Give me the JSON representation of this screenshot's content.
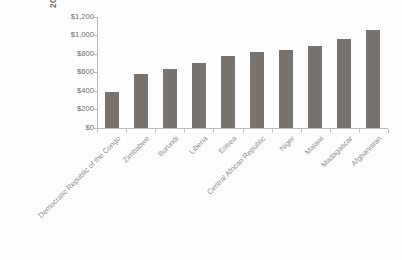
{
  "chart_data": {
    "type": "bar",
    "title": "",
    "subtitle": "",
    "xlabel": "",
    "ylabel": "2013 U.S. Dollars",
    "ylim": [
      0,
      1200
    ],
    "ytick_step": 200,
    "grid": false,
    "legend": null,
    "bar_color": "#78736f",
    "axis_color": "#b9b9b9",
    "text_color": "#6e6e6e",
    "categories": [
      "Democratic Republic of the Congo",
      "Zimbabwe",
      "Burundi",
      "Liberia",
      "Eritrea",
      "Central African Republic",
      "Niger",
      "Malawi",
      "Madagascar",
      "Afghanistan"
    ],
    "values": [
      390,
      580,
      640,
      705,
      780,
      815,
      840,
      880,
      960,
      1060
    ],
    "ytick_labels": [
      "$0",
      "$200",
      "$400",
      "$600",
      "$800",
      "$1,000",
      "$1,200"
    ],
    "ytick_values": [
      0,
      200,
      400,
      600,
      800,
      1000,
      1200
    ]
  }
}
